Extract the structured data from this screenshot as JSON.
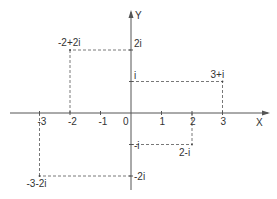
{
  "diagram": {
    "type": "complex-plane",
    "axes": {
      "x_label": "X",
      "y_label": "Y",
      "origin_label": "0"
    },
    "x_ticks": [
      {
        "value": -3,
        "label": "-3"
      },
      {
        "value": -2,
        "label": "-2"
      },
      {
        "value": -1,
        "label": "-1"
      },
      {
        "value": 1,
        "label": "1"
      },
      {
        "value": 2,
        "label": "2"
      },
      {
        "value": 3,
        "label": "3"
      }
    ],
    "y_ticks": [
      {
        "value": 2,
        "label": "2i"
      },
      {
        "value": 1,
        "label": "i"
      },
      {
        "value": -1,
        "label": "-i"
      },
      {
        "value": -2,
        "label": "-2i"
      }
    ],
    "points": [
      {
        "re": -2,
        "im": 2,
        "label": "-2+2i"
      },
      {
        "re": 3,
        "im": 1,
        "label": "3+i"
      },
      {
        "re": 2,
        "im": -1,
        "label": "2-i"
      },
      {
        "re": -3,
        "im": -2,
        "label": "-3-2i"
      }
    ]
  }
}
